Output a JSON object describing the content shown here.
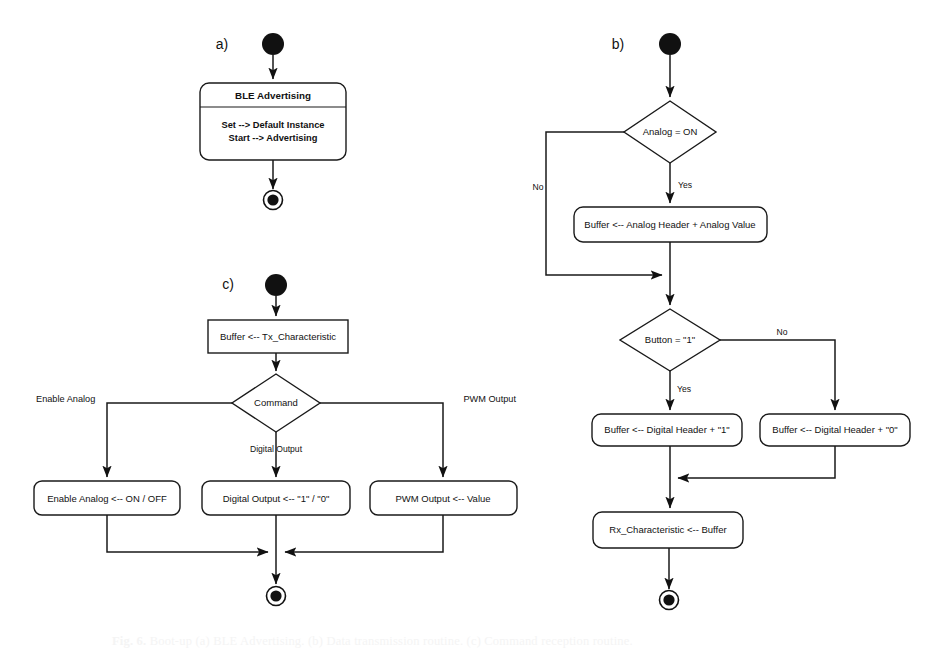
{
  "figure": {
    "caption_prefix": "Fig. 6.",
    "caption_text": "Boot-up (a) BLE Advertising. (b) Data transmission routine. (c) Command reception routine."
  },
  "panels": {
    "a": {
      "letter": "a)",
      "start_node": "initial-node",
      "end_node": "final-node",
      "activity": {
        "title": "BLE Advertising",
        "body_line_1": "Set --> Default Instance",
        "body_line_2": "Start --> Advertising"
      }
    },
    "b": {
      "letter": "b)",
      "start_node": "initial-node",
      "end_node": "final-node",
      "decision_1": {
        "label": "Analog = ON",
        "branch_yes": "Yes",
        "branch_no": "No"
      },
      "action_1": {
        "label": "Buffer  <-- Analog Header + Analog Value"
      },
      "decision_2": {
        "label": "Button = \"1\"",
        "branch_yes": "Yes",
        "branch_no": "No"
      },
      "action_2": {
        "label": "Buffer <-- Digital Header + \"1\""
      },
      "action_3": {
        "label": "Buffer <-- Digital Header + \"0\""
      },
      "action_4": {
        "label": "Rx_Characteristic <-- Buffer"
      }
    },
    "c": {
      "letter": "c)",
      "start_node": "initial-node",
      "end_node": "final-node",
      "action_1": {
        "label": "Buffer  <-- Tx_Characteristic"
      },
      "decision": {
        "label": "Command",
        "branch_left": "Enable Analog",
        "branch_down": "Digital Output",
        "branch_right": "PWM Output"
      },
      "action_left": {
        "label": "Enable Analog <-- ON / OFF"
      },
      "action_center": {
        "label": "Digital Output <-- \"1\" / \"0\""
      },
      "action_right": {
        "label": "PWM Output <-- Value"
      }
    }
  },
  "colors": {
    "stroke": "#1a1a1a",
    "fill": "#ffffff",
    "node_fill": "#111111",
    "background": "#ffffff"
  }
}
